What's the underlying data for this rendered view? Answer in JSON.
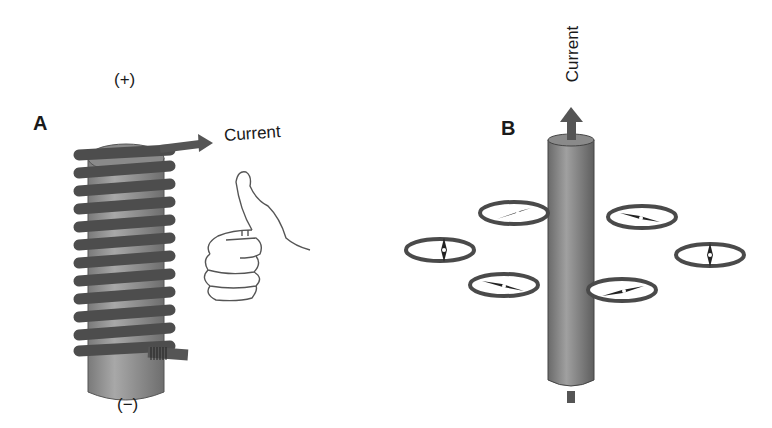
{
  "figure": {
    "panel_a": {
      "label": "A",
      "top_terminal": "(+)",
      "bottom_terminal": "(−)",
      "current_label": "Current",
      "coil_turns": 12,
      "icons": [
        "solenoid-cylinder",
        "current-arrow",
        "right-hand-thumb-icon"
      ]
    },
    "panel_b": {
      "label": "B",
      "current_label": "Current",
      "compass_count": 6,
      "icons": [
        "straight-conductor",
        "current-arrow-up",
        "compass-icon"
      ]
    },
    "colors": {
      "background": "#ffffff",
      "conductor": "#8c8c8c",
      "coil": "#4d4d4d",
      "outline": "#333333",
      "text": "#1a1a1a"
    }
  }
}
